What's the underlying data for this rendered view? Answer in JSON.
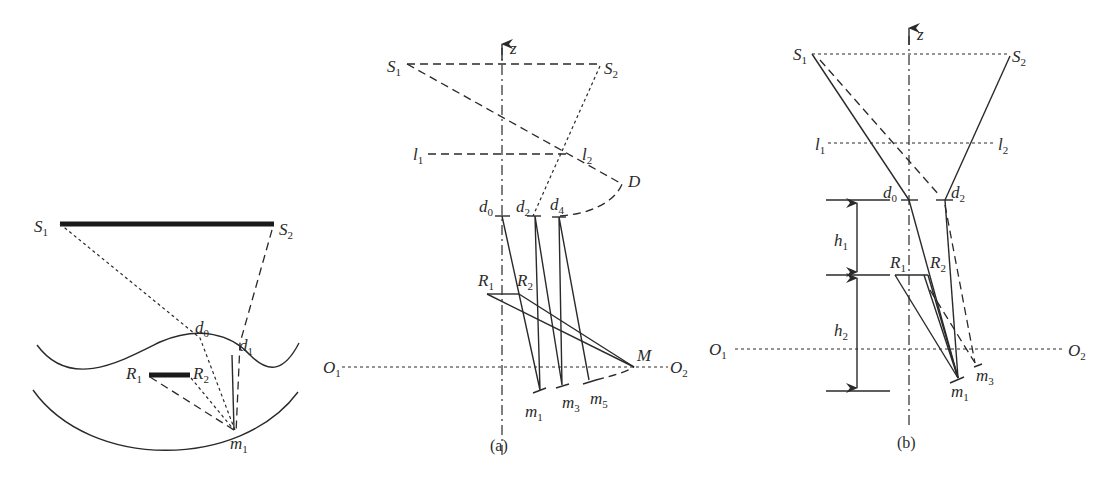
{
  "figure": {
    "left_panel": {
      "labels": {
        "S1": "S",
        "S1_sub": "1",
        "S2": "S",
        "S2_sub": "2",
        "d0": "d",
        "d0_sub": "0",
        "d1": "d",
        "d1_sub": "1",
        "R1": "R",
        "R1_sub": "1",
        "R2": "R",
        "R2_sub": "2",
        "m1": "m",
        "m1_sub": "1"
      }
    },
    "panel_a": {
      "caption": "(a)",
      "axis_label": "z",
      "labels": {
        "S1": "S",
        "S1_sub": "1",
        "S2": "S",
        "S2_sub": "2",
        "l1": "l",
        "l1_sub": "1",
        "l2": "l",
        "l2_sub": "2",
        "D": "D",
        "d0": "d",
        "d0_sub": "0",
        "d2": "d",
        "d2_sub": "2",
        "d4": "d",
        "d4_sub": "4",
        "R1": "R",
        "R1_sub": "1",
        "R2": "R",
        "R2_sub": "2",
        "M": "M",
        "O1": "O",
        "O1_sub": "1",
        "O2": "O",
        "O2_sub": "2",
        "m1": "m",
        "m1_sub": "1",
        "m3": "m",
        "m3_sub": "3",
        "m5": "m",
        "m5_sub": "5"
      }
    },
    "panel_b": {
      "caption": "(b)",
      "axis_label": "z",
      "labels": {
        "S1": "S",
        "S1_sub": "1",
        "S2": "S",
        "S2_sub": "2",
        "l1": "l",
        "l1_sub": "1",
        "l2": "l",
        "l2_sub": "2",
        "d0": "d",
        "d0_sub": "0",
        "d2": "d",
        "d2_sub": "2",
        "h1": "h",
        "h1_sub": "1",
        "h2": "h",
        "h2_sub": "2",
        "R1": "R",
        "R1_sub": "1",
        "R2": "R",
        "R2_sub": "2",
        "O1": "O",
        "O1_sub": "1",
        "O2": "O",
        "O2_sub": "2",
        "m1": "m",
        "m1_sub": "1",
        "m3": "m",
        "m3_sub": "3"
      }
    }
  }
}
